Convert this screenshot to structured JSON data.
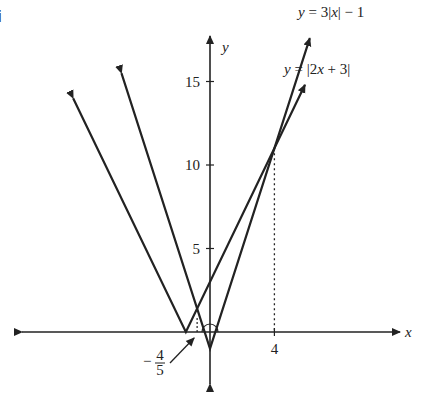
{
  "part_label": "i",
  "chart_data": {
    "type": "line",
    "title": "",
    "xlabel": "x",
    "ylabel": "y",
    "xlim": [
      -12.5,
      12.5
    ],
    "ylim": [
      -3,
      19
    ],
    "grid": false,
    "y_ticks": [
      5,
      10,
      15
    ],
    "y_tick_labels": [
      "5",
      "10",
      "15"
    ],
    "x_ticks": [
      4
    ],
    "x_tick_labels": [
      "4"
    ],
    "series": [
      {
        "name": "y=3|x|-1",
        "label_parts": [
          "y",
          " = 3|",
          "x",
          "| − 1"
        ],
        "points": [
          [
            -5.5,
            15.5
          ],
          [
            0,
            -1
          ],
          [
            6.2,
            17.6
          ]
        ],
        "arrows": "both"
      },
      {
        "name": "y=|2x+3|",
        "label_parts": [
          "y",
          " = |2",
          "x",
          " + 3|"
        ],
        "points": [
          [
            -8.5,
            14
          ],
          [
            -1.5,
            0
          ],
          [
            5.9,
            14.8
          ]
        ],
        "arrows": "both"
      }
    ],
    "annotations": [
      {
        "text": "-4/5",
        "numerator": "4",
        "denominator": "5",
        "sign": "−",
        "x": -0.8,
        "y": 0,
        "kind": "intersection-x-arrow"
      },
      {
        "text": "4",
        "x": 4,
        "y": 11,
        "kind": "dashed-drop-line"
      },
      {
        "kind": "angle-arc",
        "x": 0,
        "y": -1
      }
    ]
  }
}
